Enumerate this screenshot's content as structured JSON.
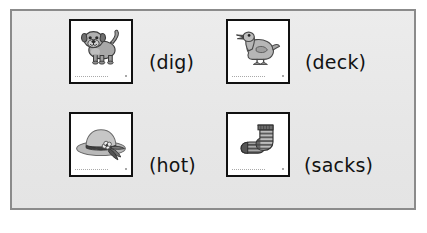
{
  "worksheet": {
    "background_color": "#e9e9e9",
    "frame_color": "#8b8b8b",
    "page_color": "#ffffff",
    "items": [
      {
        "picture": "dog-illustration",
        "picture_alt": "dog",
        "word": "(dig)",
        "card_border_color": "#111111",
        "card_background": "#ffffff"
      },
      {
        "picture": "duck-illustration",
        "picture_alt": "duck",
        "word": "(deck)",
        "card_border_color": "#111111",
        "card_background": "#ffffff"
      },
      {
        "picture": "hat-illustration",
        "picture_alt": "hat",
        "word": "(hot)",
        "card_border_color": "#111111",
        "card_background": "#ffffff"
      },
      {
        "picture": "socks-illustration",
        "picture_alt": "socks",
        "word": "(sacks)",
        "card_border_color": "#111111",
        "card_background": "#ffffff"
      }
    ]
  }
}
